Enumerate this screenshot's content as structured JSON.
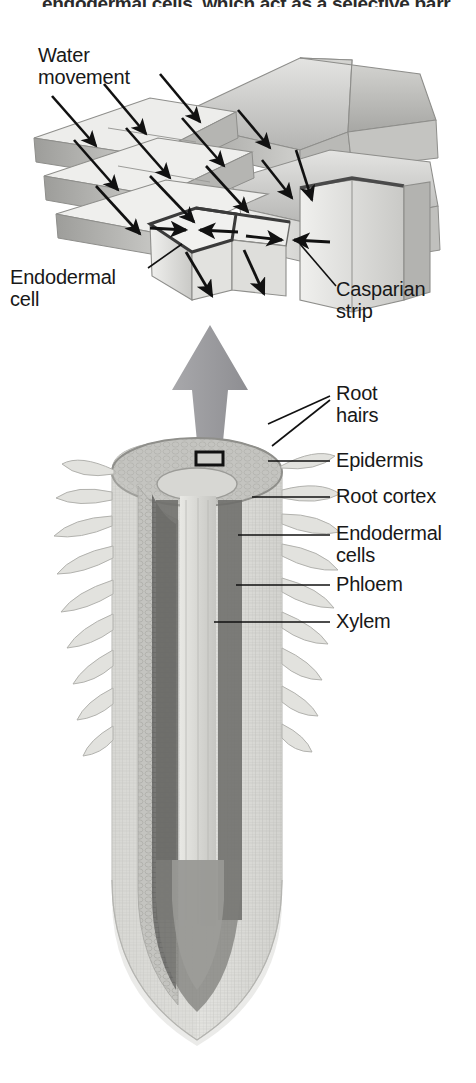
{
  "figure": {
    "title_fragment": "endodermal cells, which act as a selective barr",
    "type": "biological-diagram"
  },
  "inset_diagram": {
    "name": "endodermis-cell-block",
    "labels": {
      "water_movement": "Water\nmovement",
      "endodermal_cell": "Endodermal\ncell",
      "casparian_strip": "Casparian\nstrip"
    }
  },
  "root_diagram": {
    "name": "root-longitudinal-section",
    "labels": [
      {
        "id": "root-hairs",
        "text": "Root\nhairs",
        "x": 336,
        "y": 382
      },
      {
        "id": "epidermis",
        "text": "Epidermis",
        "x": 336,
        "y": 449
      },
      {
        "id": "root-cortex",
        "text": "Root cortex",
        "x": 336,
        "y": 485
      },
      {
        "id": "endodermal-cells",
        "text": "Endodermal\ncells",
        "x": 336,
        "y": 522
      },
      {
        "id": "phloem",
        "text": "Phloem",
        "x": 336,
        "y": 573
      },
      {
        "id": "xylem",
        "text": "Xylem",
        "x": 336,
        "y": 610
      }
    ]
  },
  "colors": {
    "ink": "#181818",
    "cell_light": "#e9e9e7",
    "cell_mid": "#c8c8c6",
    "cell_dark": "#9a9a98",
    "casparian": "#4a4a4a",
    "magnify_arrow": "#9b9b9e",
    "cortex": "#bcbcb8",
    "endodermis_band": "#6e6e6c",
    "xylem": "#d8d8d4",
    "phloem": "#8a8a86"
  }
}
